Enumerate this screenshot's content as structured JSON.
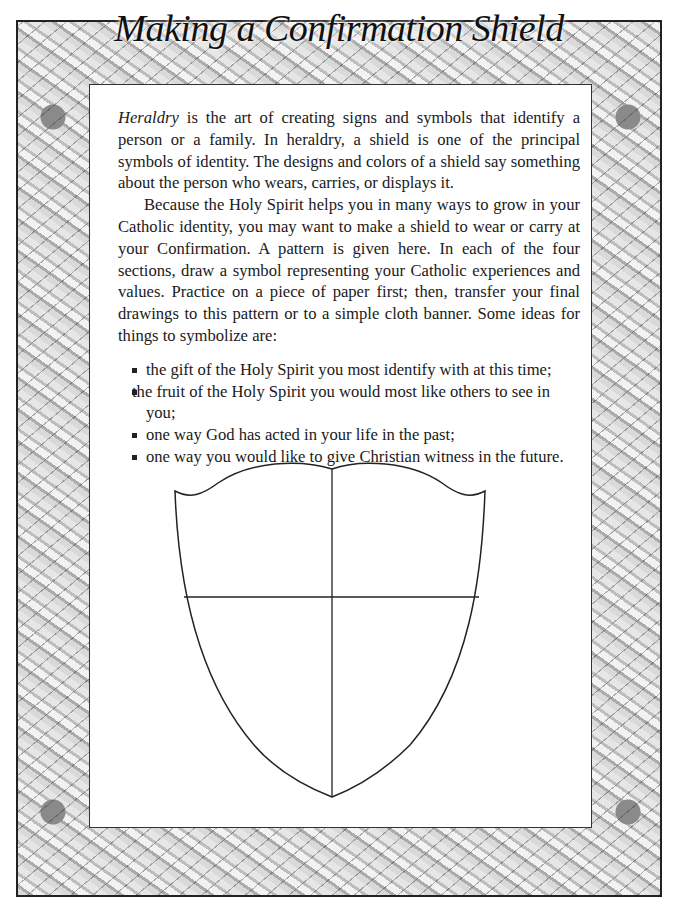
{
  "page": {
    "title": "Making a Confirmation Shield",
    "paragraph1": {
      "lead_italic": "Heraldry",
      "text": " is the art of creating signs and symbols that identify a person or a family. In heraldry, a shield is one of the principal symbols of identity. The designs and colors of a shield say something about the person who wears, carries, or displays it."
    },
    "paragraph2": "Because the Holy Spirit helps you in many ways to grow in your Catholic identity, you may want to make a shield to wear or carry at your Confirmation. A pattern is given here. In each of the four sections, draw a symbol representing your Catholic experiences and values. Practice on a piece of paper first; then, transfer your final drawings to this pattern or to a simple cloth banner. Some ideas for things to symbolize are:",
    "ideas": [
      "the gift of the Holy Spirit you most identify with at this time;",
      "the fruit of the Holy Spirit you would most like others to see in you;",
      "one way God has acted in your life in the past;",
      "one way you would like to give Christian witness in the future."
    ]
  },
  "shield": {
    "sections": 4,
    "stroke_color": "#222222"
  },
  "frame": {
    "style": "decorative floral border, grayscale watercolor",
    "tone_colors": [
      "#cfcfcf",
      "#8a8a8a",
      "#f2f2f2"
    ]
  }
}
